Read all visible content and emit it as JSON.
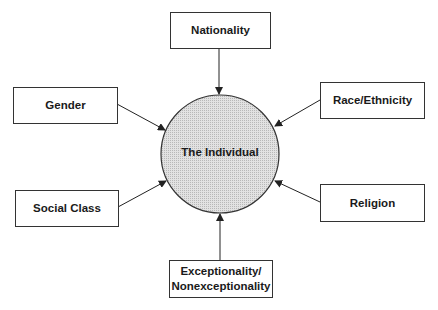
{
  "diagram": {
    "center": {
      "label": "The Individual",
      "fill": "#d4d4d4"
    },
    "factors": [
      {
        "id": "nationality",
        "label": "Nationality"
      },
      {
        "id": "gender",
        "label": "Gender"
      },
      {
        "id": "race",
        "label": "Race/Ethnicity"
      },
      {
        "id": "social-class",
        "label": "Social Class"
      },
      {
        "id": "religion",
        "label": "Religion"
      },
      {
        "id": "exceptionality",
        "label": "Exceptionality/\nNonexceptionality"
      }
    ]
  }
}
